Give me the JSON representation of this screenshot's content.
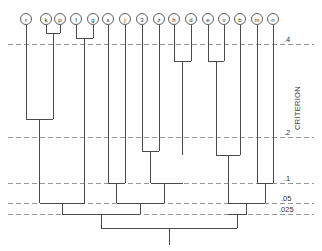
{
  "figure": {
    "type": "dendrogram",
    "axis_title": "CRITERION",
    "background": "#ffffff",
    "line_color": "#4a4a4a",
    "grid_color": "#8a8a8a"
  },
  "chart_data": {
    "type": "dendrogram",
    "title": "",
    "xlabel": "",
    "ylabel": "CRITERION",
    "orientation": "vertical-top-leaves",
    "grid": true,
    "legend": "none",
    "axis_side": "right",
    "tick_labels": [
      ".4",
      ".2",
      ".1",
      ".05",
      ".025"
    ],
    "tick_values": [
      0.4,
      0.2,
      0.1,
      0.05,
      0.025
    ],
    "tick_pixel_y": [
      44,
      137,
      183,
      203,
      214
    ],
    "leaves": [
      {
        "label": "r",
        "x": 26
      },
      {
        "label": "k",
        "x": 46
      },
      {
        "label": "p",
        "x": 60
      },
      {
        "label": "f",
        "x": 76
      },
      {
        "label": "g",
        "x": 93
      },
      {
        "label": "s",
        "x": 108
      },
      {
        "label": "j",
        "x": 125
      },
      {
        "label": "3",
        "x": 142
      },
      {
        "label": "z",
        "x": 159
      },
      {
        "label": "h",
        "x": 174
      },
      {
        "label": "d",
        "x": 191
      },
      {
        "label": "e",
        "x": 208
      },
      {
        "label": "v",
        "x": 224
      },
      {
        "label": "b",
        "x": 240
      },
      {
        "label": "m",
        "x": 257
      },
      {
        "label": "n",
        "x": 273
      }
    ],
    "leaf_circle_y": 19,
    "leaf_circle_r": 5.5,
    "stem_top_y": 25,
    "merges": [
      {
        "id": "kp",
        "left": "k",
        "right": "p",
        "y": 33,
        "x": 53
      },
      {
        "id": "fg",
        "left": "f",
        "right": "g",
        "y": 38,
        "x": 84.5
      },
      {
        "id": "he",
        "left": "h",
        "right": "d",
        "y": 61,
        "x": 182.5
      },
      {
        "id": "ev",
        "left": "e",
        "right": "v",
        "y": 61,
        "x": 216
      },
      {
        "id": "r_kp",
        "left": "r",
        "right": "kp",
        "y": 119,
        "x": 39.5
      },
      {
        "id": "3z",
        "left": "3",
        "right": "z",
        "y": 151,
        "x": 150.5
      },
      {
        "id": "hed",
        "left": "he",
        "right": "x",
        "y": 155,
        "x": 178
      },
      {
        "id": "evb",
        "left": "ev",
        "right": "b",
        "y": 155,
        "x": 228
      },
      {
        "id": "sj",
        "left": "s",
        "right": "j",
        "y": 183,
        "x": 116.5
      },
      {
        "id": "3zh",
        "left": "3z",
        "right": "hed",
        "y": 183,
        "x": 164
      },
      {
        "id": "mn",
        "left": "m",
        "right": "n",
        "y": 183,
        "x": 265
      },
      {
        "id": "rkpfg",
        "left": "r_kp",
        "right": "fg",
        "y": 203,
        "x": 62
      },
      {
        "id": "sj3z",
        "left": "sj",
        "right": "3zh",
        "y": 203,
        "x": 140
      },
      {
        "id": "evbmn",
        "left": "evb",
        "right": "mn",
        "y": 203,
        "x": 246.5
      },
      {
        "id": "leftG",
        "left": "rkpfg",
        "right": "sj3z",
        "y": 214,
        "x": 101
      },
      {
        "id": "rightG",
        "left": "evbmn",
        "right": "r2",
        "y": 214,
        "x": 237
      },
      {
        "id": "root",
        "left": "leftG",
        "right": "rightG",
        "y": 228,
        "x": 169
      }
    ],
    "root_stem_bottom_y": 245,
    "root_stem_x": 169
  }
}
